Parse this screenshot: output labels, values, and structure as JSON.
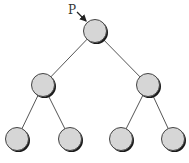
{
  "diagram": {
    "type": "binary-tree",
    "pointer_label": "P",
    "pointer_target": "root",
    "colors": {
      "node_fill": "#d6d6d6",
      "node_stroke": "#444444",
      "node_shadow": "#1a1a1a",
      "edge": "#555555"
    },
    "nodes": [
      {
        "id": "root",
        "level": 0
      },
      {
        "id": "left",
        "level": 1,
        "parent": "root"
      },
      {
        "id": "right",
        "level": 1,
        "parent": "root"
      },
      {
        "id": "left-left",
        "level": 2,
        "parent": "left"
      },
      {
        "id": "left-right",
        "level": 2,
        "parent": "left"
      },
      {
        "id": "right-left",
        "level": 2,
        "parent": "right"
      },
      {
        "id": "right-right",
        "level": 2,
        "parent": "right"
      }
    ]
  }
}
